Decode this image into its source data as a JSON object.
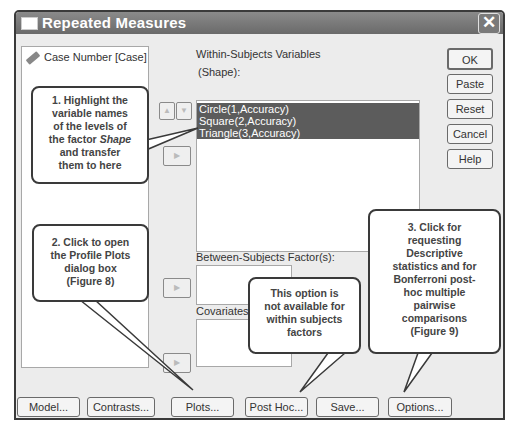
{
  "window": {
    "title": "Repeated Measures",
    "close_icon": "close-icon"
  },
  "source_list": {
    "items": [
      {
        "icon": "ruler-scale-icon",
        "label": "Case Number [Case]"
      }
    ]
  },
  "within_subjects": {
    "label_line1": "Within-Subjects Variables",
    "label_line2": "(Shape):",
    "items": [
      {
        "label": "Circle(1,Accuracy)",
        "selected": true
      },
      {
        "label": "Square(2,Accuracy)",
        "selected": true
      },
      {
        "label": "Triangle(3,Accuracy)",
        "selected": true
      }
    ]
  },
  "between_subjects": {
    "label": "Between-Subjects Factor(s):"
  },
  "covariates": {
    "label": "Covariates:"
  },
  "side_buttons": {
    "ok": "OK",
    "paste": "Paste",
    "reset": "Reset",
    "cancel": "Cancel",
    "help": "Help"
  },
  "bottom_buttons": {
    "model": "Model...",
    "contrasts": "Contrasts...",
    "plots": "Plots...",
    "post_hoc": "Post Hoc...",
    "save": "Save...",
    "options": "Options..."
  },
  "callouts": {
    "c1_a": "1. Highlight the",
    "c1_b": "variable names",
    "c1_c": "of the levels of",
    "c1_d_pre": "the factor ",
    "c1_d_em": "Shape",
    "c1_e": "and transfer",
    "c1_f": "them to here",
    "c2_a": "2. Click to open",
    "c2_b": "the Profile Plots",
    "c2_c": "dialog box",
    "c2_d": "(Figure 8)",
    "c3_a": "This option is",
    "c3_b": "not available for",
    "c3_c": "within subjects",
    "c3_d": "factors",
    "c4_a": "3. Click for",
    "c4_b": "requesting",
    "c4_c": "Descriptive",
    "c4_d": "statistics and for",
    "c4_e": "Bonferroni post-",
    "c4_f": "hoc multiple",
    "c4_g": "pairwise",
    "c4_h": "comparisons",
    "c4_i": "(Figure 9)"
  },
  "colors": {
    "titlebar": "#7a7a7a",
    "selection": "#5c5c5c",
    "dialog_bg": "#ececec"
  }
}
